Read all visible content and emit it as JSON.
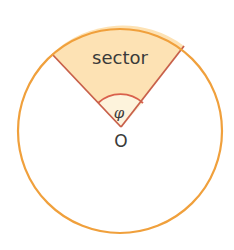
{
  "diagram": {
    "type": "circle-sector",
    "labels": {
      "sector": "sector",
      "angle": "φ",
      "center": "O"
    },
    "colors": {
      "circle_stroke": "#f0a03c",
      "sector_fill": "#fde2b4",
      "radius_stroke": "#c8604a",
      "angle_arc_stroke": "#d9604c",
      "angle_fill": "#fdf3dc",
      "text": "#3a3a3a"
    }
  }
}
